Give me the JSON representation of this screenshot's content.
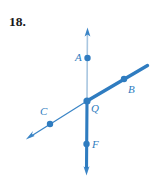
{
  "exercise": {
    "number_label": "18."
  },
  "figure": {
    "type": "geometry-line-diagram",
    "colors": {
      "line_dark_blue": "#2f7cc0",
      "line_light_blue": "#a8c6e0",
      "point_blue": "#2f7cc0",
      "number_black": "#1a1a1a",
      "background": "#ffffff"
    },
    "points": [
      {
        "name": "A",
        "label": "A",
        "cx": 87.5,
        "cy": 58,
        "r": 3.2
      },
      {
        "name": "B",
        "label": "B",
        "cx": 124,
        "cy": 79,
        "r": 3.2
      },
      {
        "name": "C",
        "label": "C",
        "cx": 50,
        "cy": 124,
        "r": 3.2
      },
      {
        "name": "Q",
        "label": "Q",
        "cx": 87,
        "cy": 101,
        "r": 3.6
      },
      {
        "name": "F",
        "label": "F",
        "cx": 86.5,
        "cy": 144,
        "r": 3.2
      }
    ],
    "lines": [
      {
        "name": "vertical-line-AF",
        "x1": 87.5,
        "y1": 30,
        "x2": 86.5,
        "y2": 174,
        "arrow_start": true,
        "arrow_end": true
      },
      {
        "name": "diagonal-line-CB",
        "x1": 27,
        "y1": 139,
        "x2": 148,
        "y2": 66,
        "arrow_start": true,
        "arrow_end": false
      }
    ],
    "segments": [
      {
        "name": "ray-QA-thin-light",
        "weight": "thin",
        "shade": "light"
      },
      {
        "name": "ray-QF-thick-dark",
        "weight": "thick",
        "shade": "dark"
      },
      {
        "name": "ray-QC-thin-dark",
        "weight": "thin",
        "shade": "dark"
      },
      {
        "name": "ray-QB-thick-dark",
        "weight": "thick",
        "shade": "dark"
      }
    ]
  }
}
